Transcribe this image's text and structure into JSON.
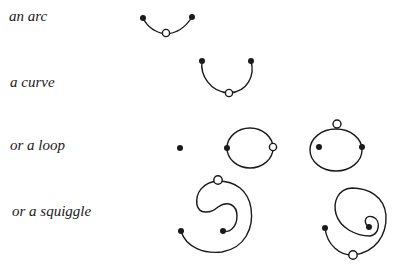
{
  "labels": {
    "arc": "an arc",
    "curve": "a curve",
    "loop": "or a loop",
    "squiggle": "or a squiggle"
  },
  "colors": {
    "ink": "#1a1a1a",
    "background": "#ffffff"
  },
  "legend": {
    "filled_dot": "endpoint",
    "open_circle": "midpoint marker"
  }
}
